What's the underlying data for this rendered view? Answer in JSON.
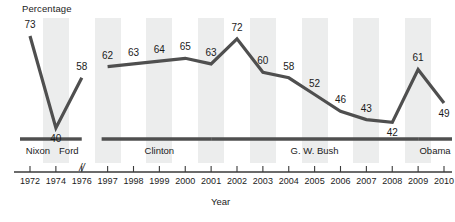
{
  "chart_data": {
    "type": "line",
    "title": "",
    "ylabel": "Percentage",
    "xlabel": "Year",
    "axis_break_after_index": 2,
    "grid": false,
    "legend": "none",
    "line_color": "#4f4f4f",
    "band_color": "#eceded",
    "categories": [
      "1972",
      "1974",
      "1976",
      "1997",
      "1998",
      "1999",
      "2000",
      "2001",
      "2002",
      "2003",
      "2004",
      "2005",
      "2006",
      "2007",
      "2008",
      "2009",
      "2010"
    ],
    "values": [
      73,
      40,
      58,
      62,
      63,
      64,
      65,
      63,
      72,
      60,
      58,
      52,
      46,
      43,
      42,
      61,
      49
    ],
    "label_positions": [
      "above",
      "below",
      "above",
      "above",
      "above",
      "above",
      "above",
      "above",
      "above",
      "above",
      "above",
      "above",
      "above",
      "above",
      "below",
      "above",
      "below"
    ],
    "ylim": [
      30,
      80
    ],
    "annotations": [
      {
        "label": "Nixon",
        "start": "1972",
        "end": "1974"
      },
      {
        "label": "Ford",
        "start": "1974",
        "end": "1976"
      },
      {
        "label": "Clinton",
        "start": "1997",
        "end": "2001"
      },
      {
        "label": "G. W. Bush",
        "start": "2001",
        "end": "2009"
      },
      {
        "label": "Obama",
        "start": "2009",
        "end": "2010"
      }
    ]
  },
  "axis": {
    "y_title": "Percentage",
    "x_title": "Year",
    "break_symbol": "//"
  },
  "tick_labels": [
    "1972",
    "1974",
    "1976",
    "1997",
    "1998",
    "1999",
    "2000",
    "2001",
    "2002",
    "2003",
    "2004",
    "2005",
    "2006",
    "2007",
    "2008",
    "2009",
    "2010"
  ],
  "point_labels": [
    "73",
    "40",
    "58",
    "62",
    "63",
    "64",
    "65",
    "63",
    "72",
    "60",
    "58",
    "52",
    "46",
    "43",
    "42",
    "61",
    "49"
  ],
  "president_labels": [
    "Nixon",
    "Ford",
    "Clinton",
    "G. W. Bush",
    "Obama"
  ]
}
